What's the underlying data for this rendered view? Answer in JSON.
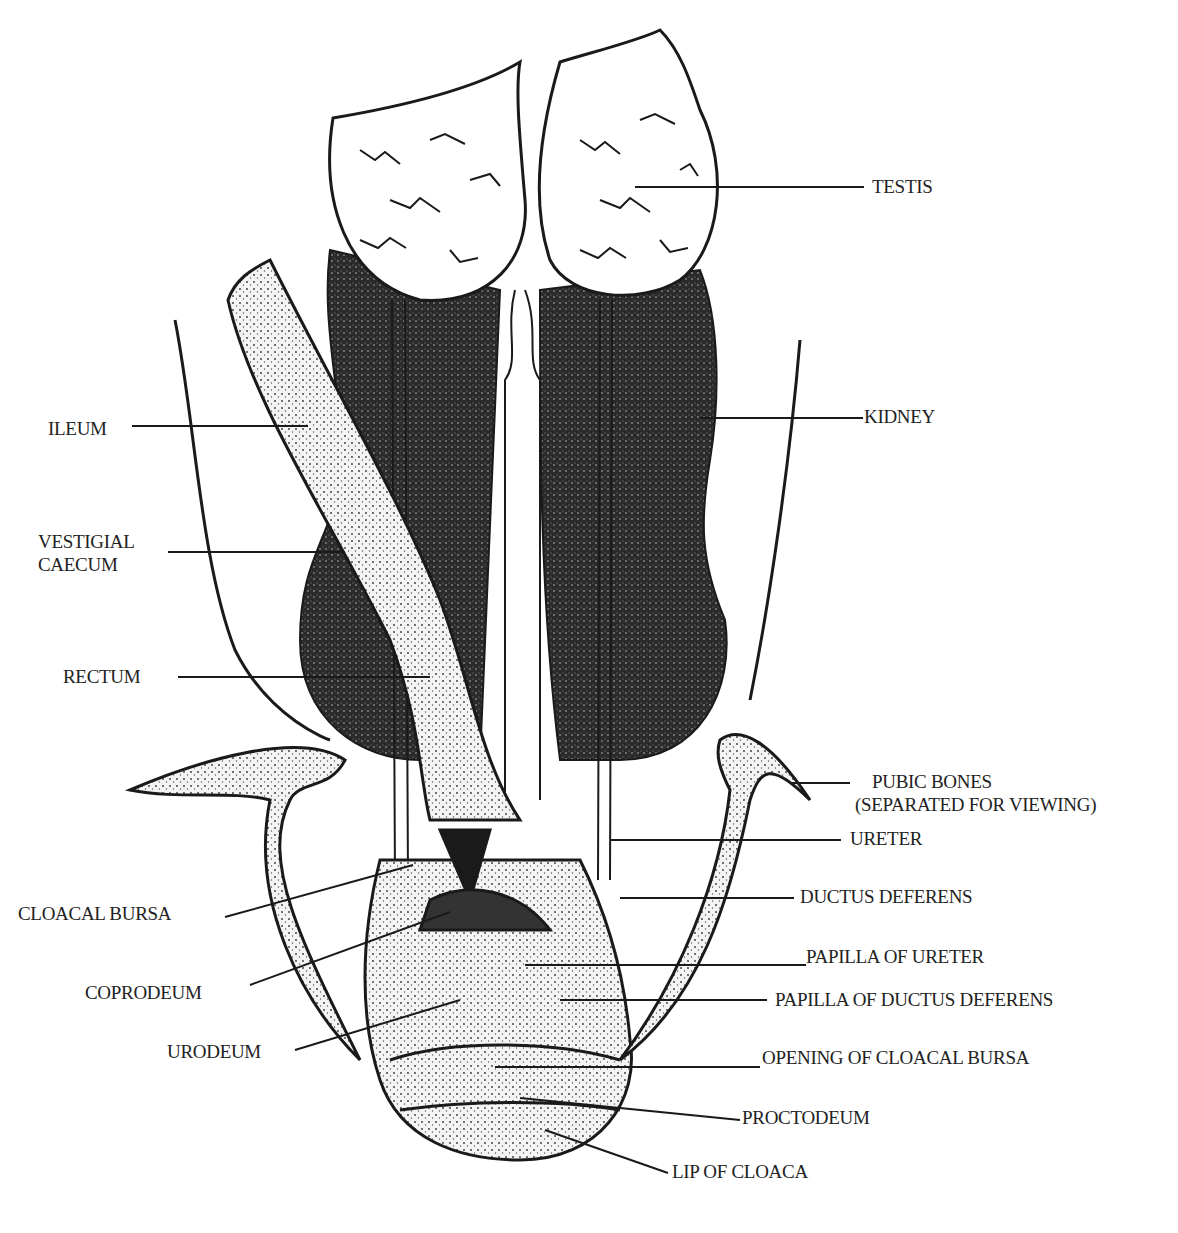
{
  "diagram": {
    "title": "",
    "labels": {
      "testis": "TESTIS",
      "kidney": "KIDNEY",
      "ileum": "ILEUM",
      "vestigial_caecum_line1": "VESTIGIAL",
      "vestigial_caecum_line2": "CAECUM",
      "rectum": "RECTUM",
      "pubic_bones_line1": "PUBIC BONES",
      "pubic_bones_line2": "(SEPARATED FOR VIEWING)",
      "ureter": "URETER",
      "cloacal_bursa": "CLOACAL BURSA",
      "ductus_deferens": "DUCTUS DEFERENS",
      "papilla_of_ureter": "PAPILLA OF URETER",
      "coprodeum": "COPRODEUM",
      "papilla_of_ductus_deferens": "PAPILLA OF DUCTUS DEFERENS",
      "urodeum": "URODEUM",
      "opening_of_cloacal_bursa": "OPENING OF CLOACAL BURSA",
      "proctodeum": "PROCTODEUM",
      "lip_of_cloaca": "LIP OF CLOACA"
    },
    "colors": {
      "ink": "#1a1a1a",
      "paper": "#ffffff",
      "kidney_fill": "#2b2b2b",
      "stipple": "#dcdcdc"
    }
  }
}
